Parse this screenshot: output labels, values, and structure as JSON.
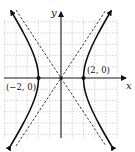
{
  "chart_data": {
    "type": "line",
    "title": "",
    "xlabel": "x",
    "ylabel": "y",
    "grid": true,
    "xlim": [
      -5,
      5
    ],
    "ylim": [
      -5,
      5
    ],
    "equation": "x^2/4 - y^2/9 = 1",
    "series": [
      {
        "name": "hyperbola",
        "style": "solid",
        "description": "right branch and left branch with arrowheads"
      },
      {
        "name": "asymptotes",
        "style": "dashed",
        "equations": [
          "y = 3x/2",
          "y = -3x/2"
        ]
      }
    ],
    "points": [
      {
        "x": -2,
        "y": 0,
        "label": "(−2, 0)"
      },
      {
        "x": 2,
        "y": 0,
        "label": "(2, 0)"
      }
    ],
    "annotations": [
      "(−2, 0)",
      "(2, 0)"
    ]
  },
  "labels": {
    "x_axis": "x",
    "y_axis": "y",
    "left_vertex": "(−2, 0)",
    "right_vertex": "(2, 0)"
  },
  "colors": {
    "curve": "#111111",
    "grid": "#b8b8b8",
    "axis": "#222222"
  }
}
